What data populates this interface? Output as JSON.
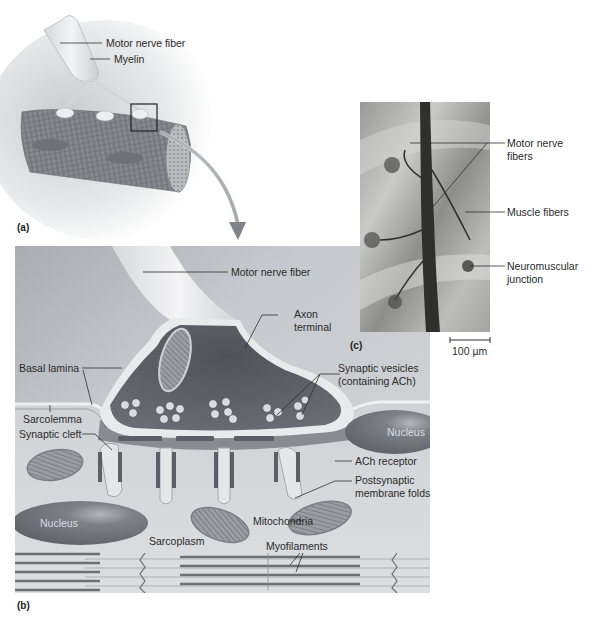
{
  "figure": {
    "panels": [
      {
        "id": "a",
        "tag": "(a)",
        "labels": {
          "motor_nerve_fiber": "Motor nerve fiber",
          "myelin": "Myelin"
        }
      },
      {
        "id": "b",
        "tag": "(b)",
        "labels": {
          "motor_nerve_fiber": "Motor nerve fiber",
          "axon_terminal_1": "Axon",
          "axon_terminal_2": "terminal",
          "basal_lamina": "Basal lamina",
          "synaptic_vesicles_1": "Synaptic vesicles",
          "synaptic_vesicles_2": "(containing ACh)",
          "sarcolemma": "Sarcolemma",
          "synaptic_cleft": "Synaptic cleft",
          "nucleus_right": "Nucleus",
          "ach_receptor": "ACh receptor",
          "postsynaptic_1": "Postsynaptic",
          "postsynaptic_2": "membrane folds",
          "nucleus_left": "Nucleus",
          "mitochondria": "Mitochondria",
          "sarcoplasm": "Sarcoplasm",
          "myofilaments": "Myofilaments"
        }
      },
      {
        "id": "c",
        "tag": "(c)",
        "labels": {
          "motor_nerve_fibers_1": "Motor nerve",
          "motor_nerve_fibers_2": "fibers",
          "muscle_fibers": "Muscle fibers",
          "neuromuscular_1": "Neuromuscular",
          "neuromuscular_2": "junction",
          "scale_bar": "100 µm"
        }
      }
    ],
    "colors": {
      "panel_bg": "#c9ccd0",
      "terminal_fill": "#5e6168",
      "nucleus": "#6f7278",
      "muscle_fiber": "#7a7d82",
      "arrow": "#8c8f93",
      "label_text": "#2a2a2a"
    }
  }
}
